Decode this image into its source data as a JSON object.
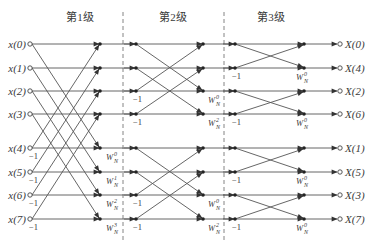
{
  "stages": [
    {
      "label": "第1级",
      "x": 80
    },
    {
      "label": "第2级",
      "x": 173
    },
    {
      "label": "第3级",
      "x": 271
    }
  ],
  "stage_dividers_x": [
    123,
    224
  ],
  "row_y": [
    44,
    68,
    91,
    114,
    148,
    172,
    195,
    219
  ],
  "columns": {
    "input": 30,
    "s1_out": 100,
    "s2_in": 136,
    "s2_out": 203,
    "s3_in": 235,
    "s3_out": 304,
    "output": 340
  },
  "inputs": [
    "x(0)",
    "x(1)",
    "x(2)",
    "x(3)",
    "x(4)",
    "x(5)",
    "x(6)",
    "x(7)"
  ],
  "outputs": [
    "X(0)",
    "X(4)",
    "X(2)",
    "X(6)",
    "X(1)",
    "X(5)",
    "X(3)",
    "X(7)"
  ],
  "minus_one": "−1",
  "twiddle_base": "W",
  "twiddle_sub": "N",
  "stage1": {
    "minus_one_rows": [
      4,
      5,
      6,
      7
    ],
    "twiddles": [
      {
        "row": 4,
        "exp": "0"
      },
      {
        "row": 5,
        "exp": "1"
      },
      {
        "row": 6,
        "exp": "2"
      },
      {
        "row": 7,
        "exp": "3"
      }
    ]
  },
  "stage2": {
    "minus_one_rows": [
      2,
      3,
      6,
      7
    ],
    "twiddles": [
      {
        "row": 2,
        "exp": "0"
      },
      {
        "row": 3,
        "exp": "2"
      },
      {
        "row": 6,
        "exp": "0"
      },
      {
        "row": 7,
        "exp": "2"
      }
    ]
  },
  "stage3": {
    "minus_one_rows": [
      1,
      3,
      5,
      7
    ],
    "twiddles": [
      {
        "row": 1,
        "exp": "0"
      },
      {
        "row": 3,
        "exp": "0"
      },
      {
        "row": 5,
        "exp": "0"
      },
      {
        "row": 7,
        "exp": "0"
      }
    ]
  },
  "colors": {
    "line": "#555555",
    "text": "#3a3a3a",
    "divider": "#777777"
  }
}
